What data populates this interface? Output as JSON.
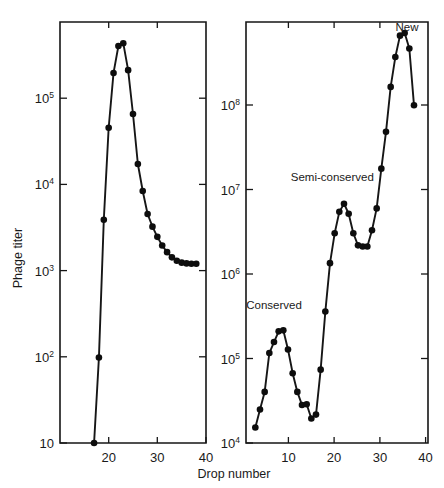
{
  "figure": {
    "xlabel": "Drop number",
    "ylabel": "Phage titer",
    "background_color": "#ffffff",
    "ink_color": "#161616"
  },
  "chart_data": [
    {
      "type": "line",
      "panel": "left",
      "title": "",
      "xlabel": "Drop number",
      "ylabel": "Phage titer",
      "yscale": "log",
      "xlim": [
        17,
        47
      ],
      "ylim": [
        10,
        500000
      ],
      "xticks": [
        20,
        30,
        40
      ],
      "xtick_labels": [
        "20",
        "30",
        "40"
      ],
      "yticks": [
        10,
        100,
        1000,
        10000,
        100000
      ],
      "ytick_labels": [
        "10",
        "10²",
        "10³",
        "10⁴",
        "10⁵"
      ],
      "grid": false,
      "legend": "none",
      "annotations": [],
      "x": [
        24,
        25,
        26,
        27,
        28,
        29,
        30,
        31,
        32,
        33,
        34,
        35,
        36,
        37,
        38,
        39,
        40,
        41,
        42,
        43,
        44,
        45
      ],
      "y": [
        10,
        90,
        3100,
        33000,
        135000,
        270000,
        290000,
        145000,
        47000,
        13000,
        6500,
        3600,
        2600,
        2000,
        1600,
        1350,
        1180,
        1080,
        1030,
        1010,
        1000,
        1000
      ]
    },
    {
      "type": "line",
      "panel": "right",
      "title": "",
      "xlabel": "Drop number",
      "ylabel": "Phage titer",
      "yscale": "log",
      "xlim": [
        2,
        41
      ],
      "ylim": [
        10000,
        600000000
      ],
      "xticks": [
        10,
        20,
        30,
        40
      ],
      "xtick_labels": [
        "10",
        "20",
        "30",
        "40"
      ],
      "yticks": [
        10000,
        100000,
        1000000,
        10000000,
        100000000
      ],
      "ytick_labels": [
        "10⁴",
        "10⁵",
        "10⁶",
        "10⁷",
        "10⁸"
      ],
      "grid": false,
      "legend": "none",
      "annotations": [
        {
          "text": "Conserved",
          "x": 8,
          "y": 330000
        },
        {
          "text": "Semi-conserved",
          "x": 20.5,
          "y": 9500000
        },
        {
          "text": "New",
          "x": 36.5,
          "y": 480000000
        }
      ],
      "x": [
        4,
        5,
        6,
        7,
        8,
        9,
        10,
        11,
        12,
        13,
        14,
        15,
        16,
        17,
        18,
        19,
        20,
        21,
        22,
        23,
        24,
        25,
        26,
        27,
        28,
        29,
        30,
        31,
        32,
        33,
        34,
        35,
        36,
        37,
        38
      ],
      "y": [
        15000,
        24000,
        38000,
        105000,
        140000,
        185000,
        190000,
        115000,
        62000,
        38000,
        27000,
        27500,
        19000,
        21000,
        68000,
        310000,
        1100000,
        2400000,
        4200000,
        5200000,
        4000000,
        2400000,
        1750000,
        1700000,
        1700000,
        2600000,
        4600000,
        13000000,
        34000000,
        110000000,
        240000000,
        420000000,
        450000000,
        300000000,
        68000000
      ]
    }
  ]
}
